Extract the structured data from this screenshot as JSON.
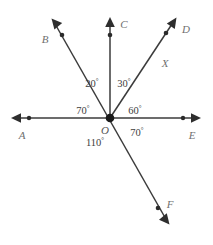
{
  "figure": {
    "vertex_label": "O",
    "line_color": "#3b3b3b",
    "label_color": "#6f6f6f",
    "background": "#ffffff"
  },
  "points": [
    {
      "id": "A",
      "label": "A",
      "direction_deg": 180
    },
    {
      "id": "B",
      "label": "B",
      "direction_deg": 110
    },
    {
      "id": "C",
      "label": "C",
      "direction_deg": 90
    },
    {
      "id": "D",
      "label": "D",
      "direction_deg": 60
    },
    {
      "id": "E",
      "label": "E",
      "direction_deg": 0
    },
    {
      "id": "F",
      "label": "F",
      "direction_deg": -62
    }
  ],
  "segment_labels": [
    {
      "id": "X",
      "label": "X"
    }
  ],
  "angles": [
    {
      "id": "angle-b-c",
      "label": "20",
      "unit": "°",
      "between": [
        "B",
        "C"
      ]
    },
    {
      "id": "angle-c-d",
      "label": "30",
      "unit": "°",
      "between": [
        "C",
        "D"
      ]
    },
    {
      "id": "angle-a-b",
      "label": "70",
      "unit": "°",
      "between": [
        "A",
        "B"
      ]
    },
    {
      "id": "angle-d-e",
      "label": "60",
      "unit": "°",
      "between": [
        "D",
        "E"
      ]
    },
    {
      "id": "angle-e-f",
      "label": "70",
      "unit": "°",
      "between": [
        "E",
        "F"
      ]
    },
    {
      "id": "angle-a-f",
      "label": "110",
      "unit": "°",
      "between": [
        "A",
        "F"
      ]
    }
  ]
}
